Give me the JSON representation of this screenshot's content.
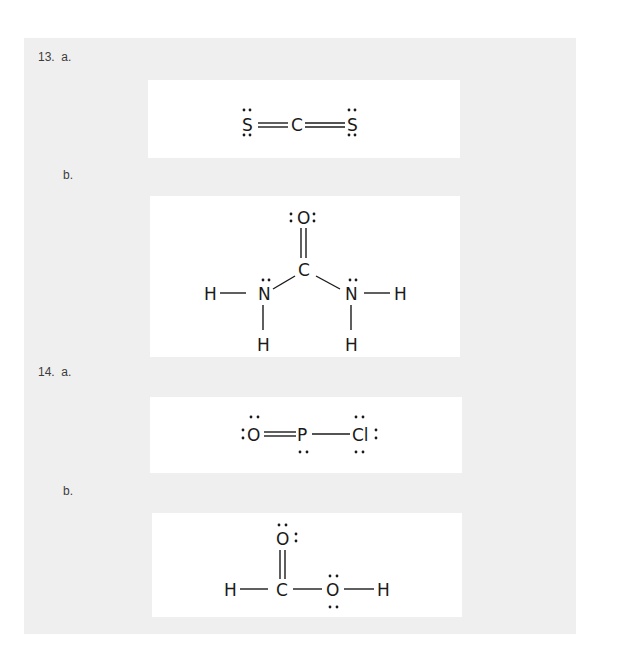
{
  "problems": [
    {
      "number_label": "13.  a.",
      "parts": [
        {
          "label": "a.",
          "molecule": "CS2",
          "atoms": {
            "s_left": "S",
            "c_center": "C",
            "s_right": "S"
          }
        },
        {
          "label": "b.",
          "molecule": "CO(NH2)2",
          "atoms": {
            "o_top": "O",
            "c_center": "C",
            "n_left": "N",
            "n_right": "N",
            "h_left": "H",
            "h_right": "H",
            "h_bottom_left": "H",
            "h_bottom_right": "H"
          }
        }
      ]
    },
    {
      "number_label": "14.  a.",
      "parts": [
        {
          "label": "a.",
          "molecule": "OPCl",
          "atoms": {
            "o_left": "O",
            "p_center": "P",
            "cl_right": "Cl"
          }
        },
        {
          "label": "b.",
          "molecule": "HCOOH",
          "atoms": {
            "o_top": "O",
            "c_center": "C",
            "h_left": "H",
            "o_right": "O",
            "h_right": "H"
          }
        }
      ]
    }
  ],
  "colors": {
    "page_bg": "#ffffff",
    "panel_bg": "#efefef",
    "box_bg": "#ffffff",
    "ink": "#1a1a1a",
    "label_text": "#3c3c3c"
  }
}
